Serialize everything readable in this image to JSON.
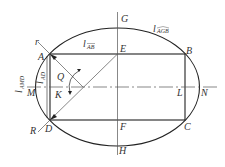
{
  "diagram": {
    "type": "geometric-construction",
    "points": {
      "A": "A",
      "B": "B",
      "C": "C",
      "D": "D",
      "E": "E",
      "F": "F",
      "G": "G",
      "H": "H",
      "K": "K",
      "L": "L",
      "M": "M",
      "N": "N",
      "Q": "Q",
      "r": "r",
      "R": "R"
    },
    "length_labels": {
      "arc_AGB": {
        "base": "l",
        "sub": "AGB"
      },
      "seg_AB": {
        "base": "l",
        "sub": "AB"
      },
      "seg_AD": {
        "base": "l",
        "sub": "AD"
      },
      "arc_AMD": {
        "base": "l",
        "sub": "AMD"
      }
    },
    "colors": {
      "stroke": "#222222",
      "axis": "#555555",
      "background": "#ffffff"
    }
  }
}
